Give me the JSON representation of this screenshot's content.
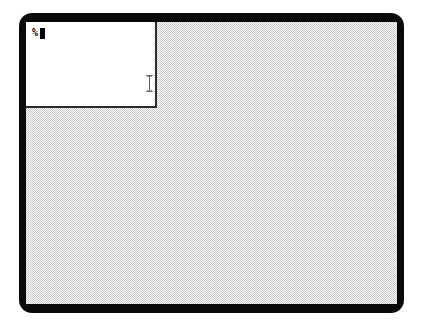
{
  "screen": {
    "width": 422,
    "height": 331,
    "background_color": "#ffffff"
  },
  "monitor": {
    "bezel_color": "#0a0a0a",
    "corner_radius_px": 13
  },
  "desktop": {
    "name": "x11-root-window",
    "pattern": "checkerboard-weave",
    "pattern_colors": [
      "#ffffff",
      "#c8c8c8"
    ],
    "background_color": "#c8c8c8"
  },
  "terminal": {
    "name": "xterm-window",
    "background_color": "#ffffff",
    "foreground_color": "#000000",
    "border_color": "#2a2a2a",
    "prompt_symbol": "%",
    "command_line_text": "",
    "cursor": {
      "icon": "block-cursor",
      "style": "filled-block",
      "color": "#000000"
    }
  },
  "pointer": {
    "icon": "ibeam-cursor",
    "label": "I",
    "color": "#808080",
    "x": 146,
    "y": 82
  }
}
